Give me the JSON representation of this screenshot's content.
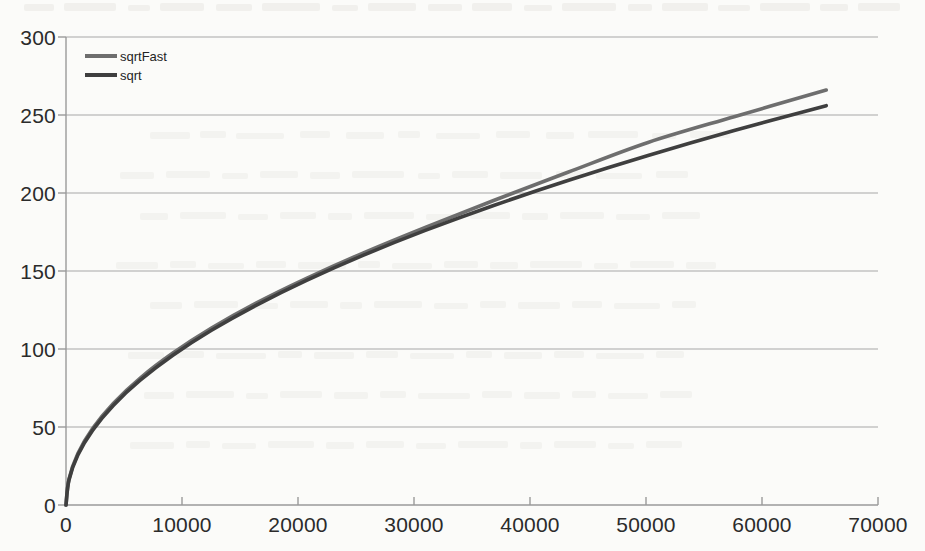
{
  "chart_data": {
    "type": "line",
    "title": "",
    "subtitle": "",
    "xlabel": "",
    "ylabel": "",
    "xlim": [
      0,
      70000
    ],
    "ylim": [
      0,
      300
    ],
    "grid": "horizontal",
    "legend_position": "top-left",
    "x_ticks": [
      "0",
      "10000",
      "20000",
      "30000",
      "40000",
      "50000",
      "60000",
      "70000"
    ],
    "x_tick_values": [
      0,
      10000,
      20000,
      30000,
      40000,
      50000,
      60000,
      70000
    ],
    "y_ticks": [
      "0",
      "50",
      "100",
      "150",
      "200",
      "250",
      "300"
    ],
    "y_tick_values": [
      0,
      50,
      100,
      150,
      200,
      250,
      300
    ],
    "x": [
      0,
      256,
      1024,
      2304,
      4096,
      6400,
      9216,
      12544,
      16384,
      20736,
      25600,
      30976,
      36864,
      43264,
      50176,
      57600,
      65536
    ],
    "series": [
      {
        "name": "sqrtFast",
        "color": "#6e6e6e",
        "values": [
          0,
          16.5,
          33.0,
          49.2,
          65.3,
          81.4,
          97.4,
          113.4,
          129.4,
          145.3,
          161.5,
          178.0,
          195.2,
          213.3,
          232.4,
          248.9,
          266.0
        ]
      },
      {
        "name": "sqrt",
        "color": "#3f3f3f",
        "values": [
          0,
          16.0,
          32.0,
          48.0,
          64.0,
          80.0,
          96.0,
          112.0,
          128.0,
          144.0,
          160.0,
          176.0,
          192.0,
          208.0,
          224.0,
          240.0,
          256.0
        ]
      }
    ]
  },
  "legend": {
    "entries": [
      {
        "label": "sqrtFast",
        "color": "#6e6e6e"
      },
      {
        "label": "sqrt",
        "color": "#3f3f3f"
      }
    ]
  },
  "axis_colors": {
    "gridline": "#a8a8a8",
    "axis": "#9a9a9a",
    "tick_text": "#2b2b2b"
  }
}
